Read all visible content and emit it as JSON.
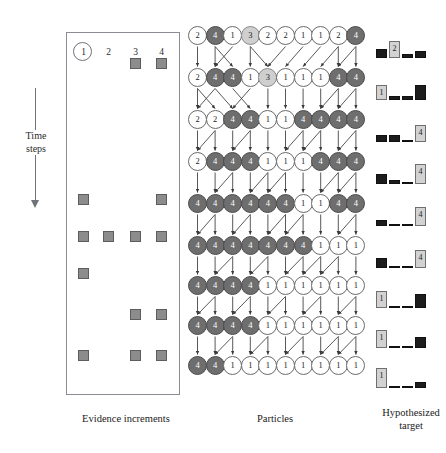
{
  "figure": {
    "captions": {
      "evidence": "Evidence increments",
      "particles": "Particles",
      "target": "Hypothesized target"
    },
    "time_axis": {
      "label": "Time\nsteps",
      "label_line1": "Time",
      "label_line2": "steps",
      "direction": "down"
    }
  },
  "evidence": {
    "column_headers": [
      "1",
      "2",
      "3",
      "4"
    ],
    "highlighted_column": "1",
    "num_rows": 9,
    "num_columns": 4,
    "square_color": "#8c8c8c",
    "square_border": "#5d5d5d",
    "rows": [
      [
        0,
        0,
        1,
        1
      ],
      [
        0,
        0,
        0,
        0
      ],
      [
        0,
        0,
        0,
        0
      ],
      [
        0,
        0,
        0,
        0
      ],
      [
        1,
        0,
        0,
        1
      ],
      [
        1,
        1,
        1,
        1
      ],
      [
        1,
        0,
        0,
        0
      ],
      [
        0,
        0,
        1,
        1
      ],
      [
        1,
        0,
        1,
        1
      ]
    ]
  },
  "particles": {
    "num_rows": 9,
    "particles_per_row": 10,
    "colors": {
      "value_4": "#6e6e6e",
      "value_3": "#cfcfcf",
      "value_1": "#ffffff",
      "value_2": "#ffffff"
    },
    "rows": [
      [
        2,
        4,
        1,
        3,
        2,
        2,
        1,
        1,
        2,
        4
      ],
      [
        2,
        4,
        4,
        1,
        3,
        1,
        1,
        1,
        4,
        4
      ],
      [
        2,
        2,
        4,
        4,
        1,
        1,
        4,
        4,
        4,
        4
      ],
      [
        2,
        4,
        4,
        4,
        1,
        1,
        1,
        4,
        4,
        4
      ],
      [
        4,
        4,
        4,
        4,
        4,
        4,
        1,
        1,
        4,
        4
      ],
      [
        4,
        4,
        4,
        4,
        4,
        4,
        4,
        1,
        1,
        1
      ],
      [
        4,
        4,
        4,
        4,
        1,
        1,
        1,
        1,
        1,
        1
      ],
      [
        4,
        4,
        4,
        4,
        1,
        1,
        1,
        1,
        1,
        1
      ],
      [
        4,
        4,
        1,
        1,
        1,
        1,
        1,
        1,
        1,
        1
      ]
    ]
  },
  "hypothesized_target": {
    "num_rows": 9,
    "bars_per_row": 4,
    "bar_colors": {
      "black": "#1c1c1c",
      "gray": "#d2d2d2"
    },
    "rows": [
      {
        "bars": [
          {
            "height": 9,
            "style": "black",
            "label": ""
          },
          {
            "height": 17,
            "style": "gray",
            "label": "2"
          },
          {
            "height": 4,
            "style": "black",
            "label": ""
          },
          {
            "height": 7,
            "style": "black",
            "label": ""
          }
        ]
      },
      {
        "bars": [
          {
            "height": 15,
            "style": "gray",
            "label": "1"
          },
          {
            "height": 4,
            "style": "black",
            "label": ""
          },
          {
            "height": 4,
            "style": "black",
            "label": ""
          },
          {
            "height": 15,
            "style": "black",
            "label": ""
          }
        ]
      },
      {
        "bars": [
          {
            "height": 7,
            "style": "black",
            "label": ""
          },
          {
            "height": 7,
            "style": "black",
            "label": ""
          },
          {
            "height": 2,
            "style": "black",
            "label": ""
          },
          {
            "height": 17,
            "style": "gray",
            "label": "4"
          }
        ]
      },
      {
        "bars": [
          {
            "height": 10,
            "style": "black",
            "label": ""
          },
          {
            "height": 4,
            "style": "black",
            "label": ""
          },
          {
            "height": 2,
            "style": "black",
            "label": ""
          },
          {
            "height": 20,
            "style": "gray",
            "label": "4"
          }
        ]
      },
      {
        "bars": [
          {
            "height": 6,
            "style": "black",
            "label": ""
          },
          {
            "height": 2,
            "style": "black",
            "label": ""
          },
          {
            "height": 2,
            "style": "black",
            "label": ""
          },
          {
            "height": 19,
            "style": "gray",
            "label": "4"
          }
        ]
      },
      {
        "bars": [
          {
            "height": 10,
            "style": "black",
            "label": ""
          },
          {
            "height": 2,
            "style": "black",
            "label": ""
          },
          {
            "height": 2,
            "style": "black",
            "label": ""
          },
          {
            "height": 18,
            "style": "gray",
            "label": "4"
          }
        ]
      },
      {
        "bars": [
          {
            "height": 17,
            "style": "gray",
            "label": "1"
          },
          {
            "height": 2,
            "style": "black",
            "label": ""
          },
          {
            "height": 2,
            "style": "black",
            "label": ""
          },
          {
            "height": 14,
            "style": "black",
            "label": ""
          }
        ]
      },
      {
        "bars": [
          {
            "height": 18,
            "style": "gray",
            "label": "1"
          },
          {
            "height": 2,
            "style": "black",
            "label": ""
          },
          {
            "height": 2,
            "style": "black",
            "label": ""
          },
          {
            "height": 11,
            "style": "black",
            "label": ""
          }
        ]
      },
      {
        "bars": [
          {
            "height": 20,
            "style": "gray",
            "label": "1"
          },
          {
            "height": 2,
            "style": "black",
            "label": ""
          },
          {
            "height": 2,
            "style": "black",
            "label": ""
          },
          {
            "height": 6,
            "style": "black",
            "label": ""
          }
        ]
      }
    ]
  },
  "chart_data": {
    "type": "diagram",
    "panels": [
      {
        "name": "Evidence increments",
        "type": "heatmap",
        "xlabel": "",
        "ylabel": "Time steps",
        "categories": [
          "1",
          "2",
          "3",
          "4"
        ],
        "rows": [
          [
            0,
            0,
            1,
            1
          ],
          [
            0,
            0,
            0,
            0
          ],
          [
            0,
            0,
            0,
            0
          ],
          [
            0,
            0,
            0,
            0
          ],
          [
            1,
            0,
            0,
            1
          ],
          [
            1,
            1,
            1,
            1
          ],
          [
            1,
            0,
            0,
            0
          ],
          [
            0,
            0,
            1,
            1
          ],
          [
            1,
            0,
            1,
            1
          ]
        ]
      },
      {
        "name": "Particles",
        "type": "table",
        "rows": [
          [
            2,
            4,
            1,
            3,
            2,
            2,
            1,
            1,
            2,
            4
          ],
          [
            2,
            4,
            4,
            1,
            3,
            1,
            1,
            1,
            4,
            4
          ],
          [
            2,
            2,
            4,
            4,
            1,
            1,
            4,
            4,
            4,
            4
          ],
          [
            2,
            4,
            4,
            4,
            1,
            1,
            1,
            4,
            4,
            4
          ],
          [
            4,
            4,
            4,
            4,
            4,
            4,
            1,
            1,
            4,
            4
          ],
          [
            4,
            4,
            4,
            4,
            4,
            4,
            4,
            1,
            1,
            1
          ],
          [
            4,
            4,
            4,
            4,
            1,
            1,
            1,
            1,
            1,
            1
          ],
          [
            4,
            4,
            4,
            4,
            1,
            1,
            1,
            1,
            1,
            1
          ],
          [
            4,
            4,
            1,
            1,
            1,
            1,
            1,
            1,
            1,
            1
          ]
        ]
      },
      {
        "name": "Hypothesized target",
        "type": "bar",
        "categories": [
          "1",
          "2",
          "3",
          "4"
        ],
        "series": [
          {
            "name": "t1",
            "values": [
              9,
              17,
              4,
              7
            ]
          },
          {
            "name": "t2",
            "values": [
              15,
              4,
              4,
              15
            ]
          },
          {
            "name": "t3",
            "values": [
              7,
              7,
              2,
              17
            ]
          },
          {
            "name": "t4",
            "values": [
              10,
              4,
              2,
              20
            ]
          },
          {
            "name": "t5",
            "values": [
              6,
              2,
              2,
              19
            ]
          },
          {
            "name": "t6",
            "values": [
              10,
              2,
              2,
              18
            ]
          },
          {
            "name": "t7",
            "values": [
              17,
              2,
              2,
              14
            ]
          },
          {
            "name": "t8",
            "values": [
              18,
              2,
              2,
              11
            ]
          },
          {
            "name": "t9",
            "values": [
              20,
              2,
              2,
              6
            ]
          }
        ]
      }
    ]
  }
}
